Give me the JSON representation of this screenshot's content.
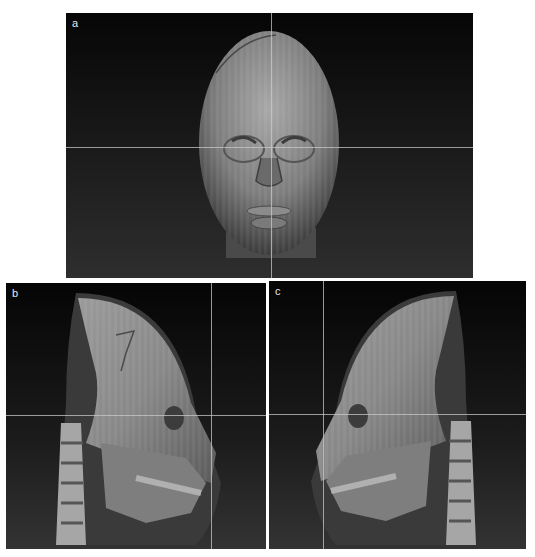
{
  "figure": {
    "panels": [
      {
        "id": "a",
        "label": "a",
        "view": "frontal 3D CT volume rendering of head with crosshair",
        "crosshair": {
          "x": 205,
          "y": 134
        }
      },
      {
        "id": "b",
        "label": "b",
        "view": "right oblique lateral 3D CT volume rendering with crosshair",
        "crosshair": {
          "x": 205,
          "y": 132
        }
      },
      {
        "id": "c",
        "label": "c",
        "view": "left oblique lateral 3D CT volume rendering with crosshair",
        "crosshair": {
          "x": 54,
          "y": 133
        }
      }
    ],
    "colors": {
      "background": "#0b0b0b",
      "crosshair": "#c8c8c8",
      "tissue_light": "#a9a9a9",
      "tissue_dark": "#3a3a3a"
    }
  }
}
